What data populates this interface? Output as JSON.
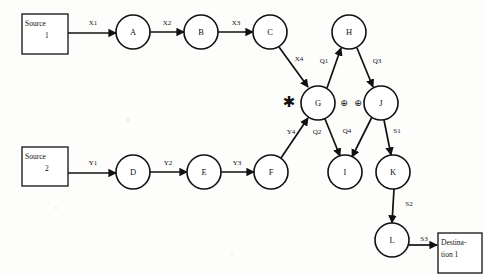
{
  "diagram": {
    "canvas": {
      "width": 485,
      "height": 275
    },
    "colors": {
      "background": "#fdfdfc",
      "stroke": "#111111",
      "node_fill": "#ffffff"
    },
    "boxes": [
      {
        "id": "source1",
        "name": "source-1-box",
        "line1": "Source",
        "line2": "1",
        "x": 22,
        "y": 14,
        "w": 46,
        "h": 40
      },
      {
        "id": "source2",
        "name": "source-2-box",
        "line1": "Source",
        "line2": "2",
        "x": 22,
        "y": 147,
        "w": 46,
        "h": 39
      },
      {
        "id": "dest1",
        "name": "destination-1-box",
        "line1": "Destina-",
        "line2": "tion 1",
        "x": 438,
        "y": 233,
        "w": 44,
        "h": 40
      }
    ],
    "nodes": [
      {
        "id": "A",
        "label": "A",
        "cx": 133,
        "cy": 32,
        "r": 17
      },
      {
        "id": "B",
        "label": "B",
        "cx": 201,
        "cy": 32,
        "r": 17
      },
      {
        "id": "C",
        "label": "C",
        "cx": 270,
        "cy": 32,
        "r": 17
      },
      {
        "id": "H",
        "label": "H",
        "cx": 349,
        "cy": 32,
        "r": 17
      },
      {
        "id": "G",
        "label": "G",
        "cx": 318,
        "cy": 103,
        "r": 17
      },
      {
        "id": "J",
        "label": "J",
        "cx": 381,
        "cy": 103,
        "r": 17
      },
      {
        "id": "D",
        "label": "D",
        "cx": 133,
        "cy": 172,
        "r": 17
      },
      {
        "id": "E",
        "label": "E",
        "cx": 204,
        "cy": 172,
        "r": 17
      },
      {
        "id": "F",
        "label": "F",
        "cx": 271,
        "cy": 172,
        "r": 17
      },
      {
        "id": "I",
        "label": "I",
        "cx": 345,
        "cy": 172,
        "r": 17
      },
      {
        "id": "K",
        "label": "K",
        "cx": 393,
        "cy": 172,
        "r": 17
      },
      {
        "id": "L",
        "label": "L",
        "cx": 392,
        "cy": 240,
        "r": 17
      }
    ],
    "edges": [
      {
        "id": "X1",
        "label": "X1",
        "from": "source1",
        "to": "A",
        "x1": 68,
        "y1": 33,
        "x2": 116,
        "y2": 33,
        "lx": 93,
        "ly": 23
      },
      {
        "id": "X2",
        "label": "X2",
        "from": "A",
        "to": "B",
        "x1": 150,
        "y1": 32,
        "x2": 184,
        "y2": 32,
        "lx": 167,
        "ly": 23
      },
      {
        "id": "X3",
        "label": "X3",
        "from": "B",
        "to": "C",
        "x1": 218,
        "y1": 32,
        "x2": 253,
        "y2": 32,
        "lx": 236,
        "ly": 23
      },
      {
        "id": "X4",
        "label": "X4",
        "from": "C",
        "to": "G",
        "x1": 279,
        "y1": 47,
        "x2": 308,
        "y2": 87,
        "lx": 299,
        "ly": 59
      },
      {
        "id": "Q1",
        "label": "Q1",
        "from": "G",
        "to": "H",
        "x1": 327,
        "y1": 88,
        "x2": 341,
        "y2": 48,
        "lx": 324,
        "ly": 61
      },
      {
        "id": "Q3",
        "label": "Q3",
        "from": "H",
        "to": "J",
        "x1": 357,
        "y1": 48,
        "x2": 373,
        "y2": 87,
        "lx": 377,
        "ly": 61
      },
      {
        "id": "Y1",
        "label": "Y1",
        "from": "source2",
        "to": "D",
        "x1": 68,
        "y1": 173,
        "x2": 116,
        "y2": 173,
        "lx": 93,
        "ly": 163
      },
      {
        "id": "Y2",
        "label": "Y2",
        "from": "D",
        "to": "E",
        "x1": 150,
        "y1": 172,
        "x2": 187,
        "y2": 172,
        "lx": 168,
        "ly": 163
      },
      {
        "id": "Y3",
        "label": "Y3",
        "from": "E",
        "to": "F",
        "x1": 221,
        "y1": 172,
        "x2": 254,
        "y2": 172,
        "lx": 237,
        "ly": 163
      },
      {
        "id": "Y4",
        "label": "Y4",
        "from": "F",
        "to": "G",
        "x1": 281,
        "y1": 158,
        "x2": 308,
        "y2": 118,
        "lx": 291,
        "ly": 132
      },
      {
        "id": "Q2",
        "label": "Q2",
        "from": "G",
        "to": "I",
        "x1": 325,
        "y1": 119,
        "x2": 340,
        "y2": 156,
        "lx": 317,
        "ly": 132
      },
      {
        "id": "Q4",
        "label": "Q4",
        "from": "J",
        "to": "I",
        "x1": 372,
        "y1": 117,
        "x2": 352,
        "y2": 157,
        "lx": 347,
        "ly": 131
      },
      {
        "id": "S1",
        "label": "S1",
        "from": "J",
        "to": "K",
        "x1": 384,
        "y1": 120,
        "x2": 391,
        "y2": 155,
        "lx": 397,
        "ly": 131
      },
      {
        "id": "S2",
        "label": "S2",
        "from": "K",
        "to": "L",
        "x1": 394,
        "y1": 189,
        "x2": 392,
        "y2": 223,
        "lx": 409,
        "ly": 204
      },
      {
        "id": "S3",
        "label": "S3",
        "from": "L",
        "to": "dest1",
        "x1": 409,
        "y1": 245,
        "x2": 437,
        "y2": 245,
        "lx": 424,
        "ly": 239
      }
    ],
    "operators": [
      {
        "id": "star",
        "name": "asterisk-operator",
        "symbol": "✱",
        "x": 289,
        "y": 102
      },
      {
        "id": "oplus-left",
        "name": "circled-plus-operator-left",
        "symbol": "⊕",
        "x": 344,
        "y": 103
      },
      {
        "id": "oplus-right",
        "name": "circled-plus-operator-right",
        "symbol": "⊕",
        "x": 358,
        "y": 103
      }
    ]
  }
}
